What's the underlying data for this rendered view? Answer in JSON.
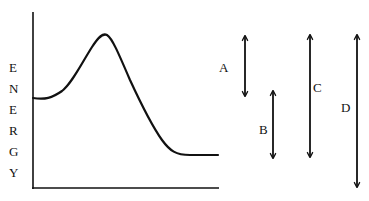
{
  "diagram": {
    "type": "energy-profile",
    "y_axis_label_letters": [
      "E",
      "N",
      "E",
      "R",
      "G",
      "Y"
    ],
    "y_axis_label": "ENERGY",
    "curve_points": [
      [
        33,
        98
      ],
      [
        42,
        99
      ],
      [
        52,
        97
      ],
      [
        62,
        91
      ],
      [
        72,
        80
      ],
      [
        82,
        63
      ],
      [
        92,
        47
      ],
      [
        99,
        37
      ],
      [
        104,
        34
      ],
      [
        109,
        37
      ],
      [
        116,
        50
      ],
      [
        130,
        80
      ],
      [
        145,
        110
      ],
      [
        158,
        135
      ],
      [
        168,
        148
      ],
      [
        178,
        154
      ],
      [
        190,
        155
      ],
      [
        218,
        155
      ]
    ],
    "arrows": [
      {
        "label": "A",
        "x": 245,
        "y1": 36,
        "y2": 96,
        "label_x": 224,
        "label_y": 70
      },
      {
        "label": "B",
        "x": 273,
        "y1": 91,
        "y2": 158,
        "label_x": 263,
        "label_y": 133
      },
      {
        "label": "C",
        "x": 310,
        "y1": 35,
        "y2": 157,
        "label_x": 317,
        "label_y": 91
      },
      {
        "label": "D",
        "x": 357,
        "y1": 35,
        "y2": 187,
        "label_x": 344,
        "label_y": 111
      }
    ],
    "colors": {
      "stroke": "#111111",
      "background": "#ffffff"
    }
  }
}
